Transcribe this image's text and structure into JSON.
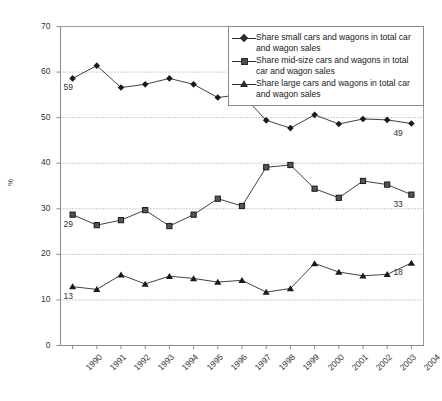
{
  "chart_data": {
    "type": "line",
    "title": "",
    "xlabel": "",
    "ylabel": "%",
    "ylim": [
      0,
      70
    ],
    "ytick_step": 10,
    "yticks": [
      "70",
      "60",
      "50",
      "40",
      "30",
      "20",
      "10",
      "0"
    ],
    "grid": "horizontal-dotted",
    "legend_position": "top-right-inside",
    "categories": [
      "1990",
      "1991",
      "1992",
      "1993",
      "1994",
      "1995",
      "1996",
      "1997",
      "1998",
      "1999",
      "2000",
      "2001",
      "2002",
      "2003",
      "2004"
    ],
    "series": [
      {
        "name": "Share small cars and wagons in total car and wagon sales",
        "marker": "diamond",
        "values": [
          58.5,
          61.3,
          56.5,
          57.2,
          58.5,
          57.2,
          54.3,
          55.0,
          49.3,
          47.6,
          50.5,
          48.5,
          49.6,
          49.4,
          48.6
        ],
        "first_label": "59",
        "last_label": "49"
      },
      {
        "name": "Share mid-size cars and wagons in total car and wagon sales",
        "marker": "square",
        "values": [
          28.6,
          26.3,
          27.4,
          29.6,
          26.1,
          28.6,
          32.1,
          30.5,
          39.0,
          39.5,
          34.3,
          32.3,
          36.0,
          35.2,
          33.0
        ],
        "first_label": "29",
        "last_label": "33"
      },
      {
        "name": "Share large cars and wagons in total car and wagon sales",
        "marker": "triangle",
        "values": [
          12.8,
          12.2,
          15.4,
          13.4,
          15.1,
          14.6,
          13.8,
          14.2,
          11.6,
          12.4,
          17.9,
          16.0,
          15.2,
          15.5,
          18.0
        ],
        "first_label": "13",
        "last_label": "18"
      }
    ],
    "colors": {
      "line": "#2b2b2b",
      "grid": "#9a9a9a",
      "axis": "#8a8a8a",
      "text": "#1a1a1a",
      "background": "#ffffff"
    }
  },
  "legend": {
    "items": [
      {
        "marker": "diamond",
        "label": "Share small cars and wagons in total car and wagon sales"
      },
      {
        "marker": "square",
        "label": "Share mid-size cars and wagons in total car and wagon sales"
      },
      {
        "marker": "triangle",
        "label": "Share large cars and wagons in total car and wagon sales"
      }
    ]
  }
}
